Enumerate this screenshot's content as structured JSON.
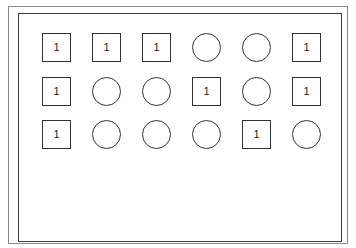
{
  "diagram": {
    "grid": {
      "rows": 3,
      "cols": 6,
      "origin_x": 42,
      "origin_y": 33,
      "col_pitch": 50,
      "row_pitch": 43.5
    },
    "cells": [
      [
        {
          "shape": "square",
          "label": "1"
        },
        {
          "shape": "square",
          "label": "1"
        },
        {
          "shape": "square",
          "label": "1"
        },
        {
          "shape": "circle",
          "label": ""
        },
        {
          "shape": "circle",
          "label": ""
        },
        {
          "shape": "square",
          "label": "1"
        }
      ],
      [
        {
          "shape": "square",
          "label": "1"
        },
        {
          "shape": "circle",
          "label": ""
        },
        {
          "shape": "circle",
          "label": ""
        },
        {
          "shape": "square",
          "label": "1"
        },
        {
          "shape": "circle",
          "label": ""
        },
        {
          "shape": "square",
          "label": "1"
        }
      ],
      [
        {
          "shape": "square",
          "label": "1"
        },
        {
          "shape": "circle",
          "label": ""
        },
        {
          "shape": "circle",
          "label": ""
        },
        {
          "shape": "circle",
          "label": ""
        },
        {
          "shape": "square",
          "label": "1"
        },
        {
          "shape": "circle",
          "label": ""
        }
      ]
    ]
  }
}
